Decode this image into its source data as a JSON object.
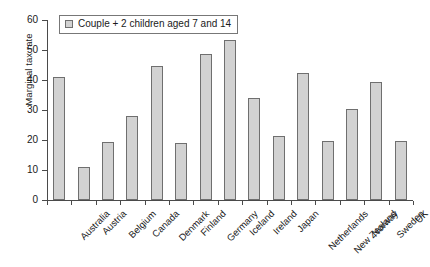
{
  "chart_data": {
    "type": "bar",
    "title": "",
    "xlabel": "",
    "ylabel": "Marginal tax rate",
    "ylim": [
      0,
      60
    ],
    "yticks": [
      0,
      10,
      20,
      30,
      40,
      50,
      60
    ],
    "grid": false,
    "legend_position": "top-left",
    "categories": [
      "Australia",
      "Austria",
      "Belgium",
      "Canada",
      "Denmark",
      "Finland",
      "Germany",
      "Iceland",
      "Ireland",
      "Japan",
      "Netherlands",
      "New Zealand",
      "Norway",
      "Sweden",
      "UK"
    ],
    "series": [
      {
        "name": "Couple + 2 children aged 7 and 14",
        "color": "#d2d2d2",
        "values": [
          41.0,
          11.0,
          19.5,
          28.0,
          44.7,
          19.0,
          48.7,
          53.3,
          34.0,
          21.3,
          42.3,
          19.7,
          30.4,
          39.4,
          19.7
        ]
      }
    ]
  },
  "legend": {
    "entries": [
      {
        "label": "Couple + 2 children aged 7 and 14",
        "swatch_name": "legend-swatch-couple-2-children"
      }
    ]
  },
  "axes": {
    "y_title": "Marginal tax rate"
  }
}
